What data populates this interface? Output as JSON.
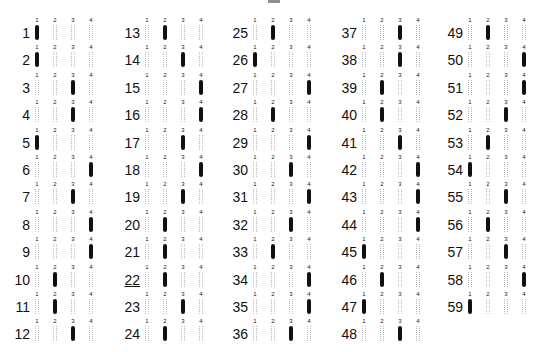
{
  "sheet": {
    "choice_labels": [
      "1",
      "2",
      "3",
      "4"
    ],
    "columns": [
      {
        "questions": [
          {
            "n": "1",
            "answer": 1
          },
          {
            "n": "2",
            "answer": 1
          },
          {
            "n": "3",
            "answer": 3
          },
          {
            "n": "4",
            "answer": 3
          },
          {
            "n": "5",
            "answer": 1
          },
          {
            "n": "6",
            "answer": 4
          },
          {
            "n": "7",
            "answer": 3
          },
          {
            "n": "8",
            "answer": 4
          },
          {
            "n": "9",
            "answer": 4
          },
          {
            "n": "10",
            "answer": 2
          },
          {
            "n": "11",
            "answer": 2
          },
          {
            "n": "12",
            "answer": 3
          }
        ]
      },
      {
        "questions": [
          {
            "n": "13",
            "answer": 2
          },
          {
            "n": "14",
            "answer": 3
          },
          {
            "n": "15",
            "answer": 4
          },
          {
            "n": "16",
            "answer": 4
          },
          {
            "n": "17",
            "answer": 3
          },
          {
            "n": "18",
            "answer": 4
          },
          {
            "n": "19",
            "answer": 3
          },
          {
            "n": "20",
            "answer": 2
          },
          {
            "n": "21",
            "answer": 2
          },
          {
            "n": "22",
            "answer": 2,
            "underlined": true
          },
          {
            "n": "23",
            "answer": 3
          },
          {
            "n": "24",
            "answer": 2
          }
        ]
      },
      {
        "questions": [
          {
            "n": "25",
            "answer": 2
          },
          {
            "n": "26",
            "answer": 1
          },
          {
            "n": "27",
            "answer": 4
          },
          {
            "n": "28",
            "answer": 2
          },
          {
            "n": "29",
            "answer": 4
          },
          {
            "n": "30",
            "answer": 3
          },
          {
            "n": "31",
            "answer": 4
          },
          {
            "n": "32",
            "answer": 3
          },
          {
            "n": "33",
            "answer": 2
          },
          {
            "n": "34",
            "answer": 4
          },
          {
            "n": "35",
            "answer": 4
          },
          {
            "n": "36",
            "answer": 3
          }
        ]
      },
      {
        "questions": [
          {
            "n": "37",
            "answer": 3
          },
          {
            "n": "38",
            "answer": 3
          },
          {
            "n": "39",
            "answer": 2
          },
          {
            "n": "40",
            "answer": 2
          },
          {
            "n": "41",
            "answer": 3
          },
          {
            "n": "42",
            "answer": 4
          },
          {
            "n": "43",
            "answer": 4
          },
          {
            "n": "44",
            "answer": 4
          },
          {
            "n": "45",
            "answer": 1
          },
          {
            "n": "46",
            "answer": 2
          },
          {
            "n": "47",
            "answer": 1
          },
          {
            "n": "48",
            "answer": 3
          }
        ]
      },
      {
        "questions": [
          {
            "n": "49",
            "answer": 2
          },
          {
            "n": "50",
            "answer": 4
          },
          {
            "n": "51",
            "answer": 4
          },
          {
            "n": "52",
            "answer": 3
          },
          {
            "n": "53",
            "answer": 2
          },
          {
            "n": "54",
            "answer": 1
          },
          {
            "n": "55",
            "answer": 3
          },
          {
            "n": "56",
            "answer": 2
          },
          {
            "n": "57",
            "answer": 3
          },
          {
            "n": "58",
            "answer": 4
          },
          {
            "n": "59",
            "answer": 1
          }
        ]
      }
    ],
    "colors": {
      "ink": "#111111",
      "bubble_outline": "#bbbbbb",
      "paper": "#ffffff"
    }
  }
}
